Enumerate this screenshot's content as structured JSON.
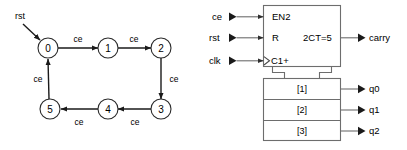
{
  "figure": {
    "panels": [
      "state-machine",
      "block-symbol"
    ]
  },
  "state_machine": {
    "reset_label": "rst",
    "states": [
      {
        "id": "s0",
        "label": "0",
        "cx": 48,
        "cy": 48
      },
      {
        "id": "s1",
        "label": "1",
        "cx": 108,
        "cy": 48
      },
      {
        "id": "s2",
        "label": "2",
        "cx": 161,
        "cy": 48
      },
      {
        "id": "s3",
        "label": "3",
        "cx": 161,
        "cy": 109
      },
      {
        "id": "s4",
        "label": "4",
        "cx": 108,
        "cy": 109
      },
      {
        "id": "s5",
        "label": "5",
        "cx": 50,
        "cy": 109
      }
    ],
    "transitions": [
      {
        "from": "0",
        "to": "1",
        "label": "ce",
        "lx": 78,
        "ly": 42
      },
      {
        "from": "1",
        "to": "2",
        "label": "ce",
        "lx": 134,
        "ly": 42
      },
      {
        "from": "2",
        "to": "3",
        "label": "ce",
        "lx": 174,
        "ly": 81
      },
      {
        "from": "3",
        "to": "4",
        "label": "ce",
        "lx": 135,
        "ly": 124
      },
      {
        "from": "4",
        "to": "5",
        "label": "ce",
        "lx": 79,
        "ly": 124
      },
      {
        "from": "5",
        "to": "0",
        "label": "ce",
        "lx": 38,
        "ly": 81
      }
    ]
  },
  "block_symbol": {
    "control_block": {
      "enable_label": "EN2",
      "reset_label": "R",
      "clock_label": "C1+",
      "carry_label": "2CT=5"
    },
    "inputs": [
      {
        "name": "ce",
        "label": "ce",
        "y": 17
      },
      {
        "name": "rst",
        "label": "rst",
        "y": 38
      },
      {
        "name": "clk",
        "label": "clk",
        "y": 61
      }
    ],
    "outputs": [
      {
        "name": "carry",
        "label": "carry",
        "y": 38
      },
      {
        "name": "q0",
        "label": "q0",
        "y": 89
      },
      {
        "name": "q1",
        "label": "q1",
        "y": 110
      },
      {
        "name": "q2",
        "label": "q2",
        "y": 131
      }
    ],
    "array_cells": [
      {
        "label": "[1]",
        "y": 89
      },
      {
        "label": "[2]",
        "y": 110
      },
      {
        "label": "[3]",
        "y": 131
      }
    ]
  },
  "colors": {
    "background": "#ffffff",
    "state_stroke": "#2a2a2a",
    "edge_stroke": "#1a1a1a",
    "block_stroke": "#6d6d6d",
    "text": "#000000"
  }
}
